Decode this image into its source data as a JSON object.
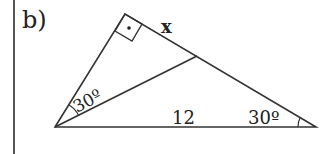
{
  "part_label": "b)",
  "labels": {
    "side_x": "x",
    "base_length": "12",
    "angle_left": "30º",
    "angle_right": "30º"
  },
  "right_angle_marker": "dot"
}
